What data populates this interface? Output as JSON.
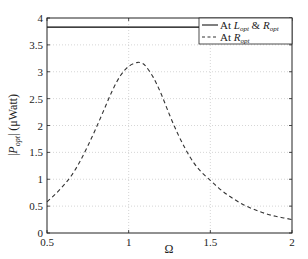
{
  "chart_data": {
    "type": "line",
    "title": "",
    "xlabel": "Ω",
    "ylabel": "|P_opt| (μWatt)",
    "xlim": [
      0.5,
      2
    ],
    "ylim": [
      0,
      4
    ],
    "xticks": [
      0.5,
      1,
      1.5,
      2
    ],
    "xtick_labels": [
      "0.5",
      "1",
      "1.5",
      "2"
    ],
    "yticks": [
      0,
      0.5,
      1,
      1.5,
      2,
      2.5,
      3,
      3.5,
      4
    ],
    "ytick_labels": [
      "0",
      "0.5",
      "1",
      "1.5",
      "2",
      "2.5",
      "3",
      "3.5",
      "4"
    ],
    "grid": true,
    "legend_position": "upper right",
    "series": [
      {
        "name": "At L_opt & R_opt",
        "style": "solid",
        "color": "#000000",
        "x": [
          0.5,
          2.0
        ],
        "y": [
          3.83,
          3.83
        ]
      },
      {
        "name": "At R_opt",
        "style": "dashed",
        "color": "#333333",
        "x": [
          0.5,
          0.55,
          0.6,
          0.65,
          0.7,
          0.75,
          0.8,
          0.85,
          0.9,
          0.95,
          1.0,
          1.05,
          1.07,
          1.1,
          1.15,
          1.2,
          1.25,
          1.3,
          1.35,
          1.4,
          1.45,
          1.5,
          1.55,
          1.6,
          1.65,
          1.7,
          1.75,
          1.8,
          1.85,
          1.9,
          1.95,
          2.0
        ],
        "y": [
          0.58,
          0.72,
          0.88,
          1.07,
          1.32,
          1.62,
          1.95,
          2.3,
          2.65,
          2.93,
          3.1,
          3.17,
          3.17,
          3.12,
          2.9,
          2.58,
          2.2,
          1.85,
          1.55,
          1.3,
          1.12,
          0.98,
          0.84,
          0.72,
          0.62,
          0.53,
          0.46,
          0.4,
          0.35,
          0.31,
          0.28,
          0.25
        ]
      }
    ]
  },
  "legend": {
    "entries": [
      {
        "prefix": "At ",
        "var": "L",
        "sub1": "opt",
        "amp": " & ",
        "var2": "R",
        "sub2": "opt"
      },
      {
        "prefix": "At ",
        "var": "R",
        "sub1": "opt"
      }
    ]
  },
  "axes": {
    "xlabel": "Ω",
    "ylabel_var": "P",
    "ylabel_sub": "opt",
    "ylabel_unit": "(μWatt)"
  }
}
